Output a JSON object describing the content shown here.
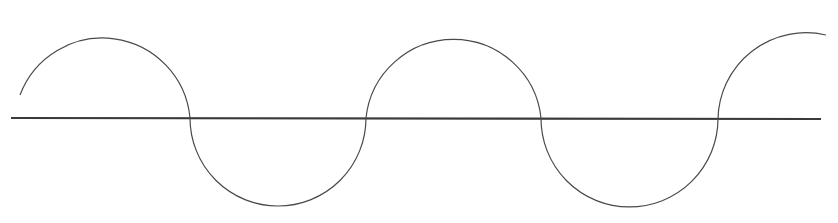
{
  "diagram": {
    "type": "alternating-semicircle-wave",
    "colors": {
      "background": "#ffffff",
      "axis": "#3a3a3a",
      "curve": "#4a4a4a"
    },
    "axis": {
      "x1": 11,
      "y1": 118,
      "x2": 821,
      "y2": 119
    },
    "crossings": [
      190,
      366,
      541,
      718
    ],
    "arcs": [
      {
        "id": "arc-1",
        "position": "above",
        "d": "M 20 95 A 88 88 0 0 1 190 118"
      },
      {
        "id": "arc-2",
        "position": "below",
        "d": "M 190 118 A 88 88 0 0 0 366 118"
      },
      {
        "id": "arc-3",
        "position": "above",
        "d": "M 366 118 A 88 88 0 0 1 541 118"
      },
      {
        "id": "arc-4",
        "position": "below",
        "d": "M 541 118 A 88 88 0 0 0 718 119"
      },
      {
        "id": "arc-5",
        "position": "above",
        "d": "M 718 119 A 88 88 0 0 1 826 35"
      }
    ]
  }
}
